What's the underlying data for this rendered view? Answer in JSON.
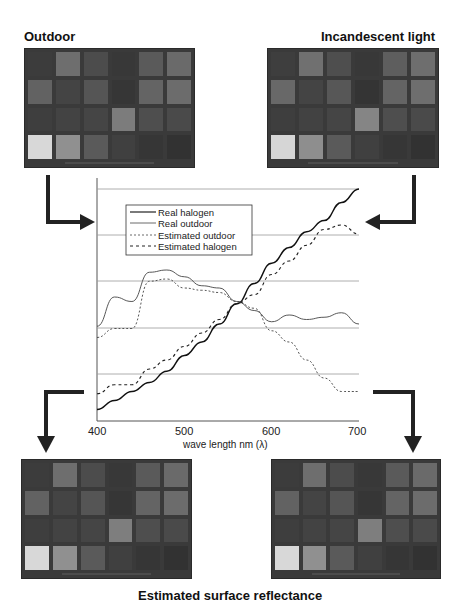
{
  "labels": {
    "top_left": "Outdoor",
    "top_right": "Incandescent light",
    "bottom": "Estimated surface reflectance"
  },
  "checker_patches": {
    "outdoor": [
      "#3c3c3c",
      "#6e6e6e",
      "#4c4c4c",
      "#383838",
      "#5a5a5a",
      "#6a6a6a",
      "#626262",
      "#444444",
      "#555555",
      "#363636",
      "#646464",
      "#6c6c6c",
      "#3e3e3e",
      "#434343",
      "#454545",
      "#7c7c7c",
      "#4e4e4e",
      "#4a4a4a",
      "#d8d8d8",
      "#909090",
      "#5a5a5a",
      "#404040",
      "#363636",
      "#323232"
    ],
    "incandescent": [
      "#3e3e3e",
      "#707070",
      "#4e4e4e",
      "#383838",
      "#5e5e5e",
      "#6e6e6e",
      "#686868",
      "#444444",
      "#575757",
      "#343434",
      "#646464",
      "#6e6e6e",
      "#3e3e3e",
      "#424242",
      "#454545",
      "#858585",
      "#4e4e4e",
      "#4a4a4a",
      "#d6d6d6",
      "#8e8e8e",
      "#5a5a5a",
      "#404040",
      "#363636",
      "#323232"
    ],
    "estimated_left": [
      "#3c3c3c",
      "#6e6e6e",
      "#4c4c4c",
      "#383838",
      "#5a5a5a",
      "#6a6a6a",
      "#626262",
      "#444444",
      "#555555",
      "#363636",
      "#646464",
      "#6c6c6c",
      "#3e3e3e",
      "#434343",
      "#454545",
      "#7e7e7e",
      "#4e4e4e",
      "#4a4a4a",
      "#d8d8d8",
      "#909090",
      "#5a5a5a",
      "#404040",
      "#363636",
      "#323232"
    ],
    "estimated_right": [
      "#3c3c3c",
      "#6e6e6e",
      "#4c4c4c",
      "#383838",
      "#5a5a5a",
      "#6a6a6a",
      "#626262",
      "#444444",
      "#555555",
      "#363636",
      "#646464",
      "#6c6c6c",
      "#3e3e3e",
      "#434343",
      "#454545",
      "#7e7e7e",
      "#4e4e4e",
      "#4a4a4a",
      "#d8d8d8",
      "#909090",
      "#5a5a5a",
      "#404040",
      "#363636",
      "#323232"
    ]
  },
  "chart_data": {
    "type": "line",
    "title": "",
    "xlabel": "wave length nm (λ)",
    "ylabel": "",
    "xlim": [
      400,
      700
    ],
    "x_ticks": [
      "400",
      "500",
      "600",
      "700"
    ],
    "grid": "horizontal",
    "legend_position": "upper-left",
    "legend": [
      "Real halogen",
      "Real outdoor",
      "Estimated outdoor",
      "Estimated halogen"
    ],
    "y_units": "relative (unlabeled, 0-1 normalized)",
    "x": [
      400,
      420,
      440,
      460,
      480,
      500,
      520,
      540,
      560,
      580,
      600,
      620,
      640,
      660,
      680,
      700
    ],
    "series": [
      {
        "name": "Real halogen",
        "style": "solid-bold",
        "values": [
          0.02,
          0.06,
          0.1,
          0.14,
          0.19,
          0.26,
          0.32,
          0.4,
          0.49,
          0.58,
          0.67,
          0.74,
          0.81,
          0.86,
          0.94,
          1.0
        ]
      },
      {
        "name": "Real outdoor",
        "style": "solid-thin",
        "values": [
          0.39,
          0.52,
          0.5,
          0.63,
          0.64,
          0.61,
          0.57,
          0.56,
          0.5,
          0.46,
          0.41,
          0.44,
          0.42,
          0.43,
          0.45,
          0.4
        ]
      },
      {
        "name": "Estimated outdoor",
        "style": "dotted",
        "values": [
          0.34,
          0.38,
          0.38,
          0.59,
          0.6,
          0.56,
          0.55,
          0.54,
          0.5,
          0.47,
          0.37,
          0.32,
          0.24,
          0.16,
          0.1,
          0.1
        ]
      },
      {
        "name": "Estimated halogen",
        "style": "dashed",
        "values": [
          0.09,
          0.13,
          0.13,
          0.2,
          0.24,
          0.3,
          0.36,
          0.42,
          0.49,
          0.53,
          0.62,
          0.68,
          0.75,
          0.82,
          0.84,
          0.8
        ]
      }
    ]
  }
}
